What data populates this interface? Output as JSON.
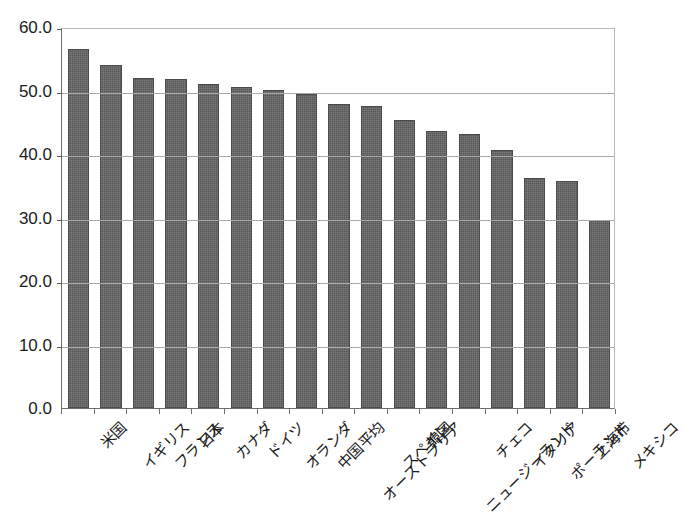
{
  "chart_data": {
    "type": "bar",
    "title": "",
    "subtitle": "",
    "xlabel": "",
    "ylabel": "",
    "ylim": [
      0.0,
      60.0
    ],
    "ytick_step": 10.0,
    "ytick_labels": [
      "60.0",
      "50.0",
      "40.0",
      "30.0",
      "20.0",
      "10.0",
      "0.0"
    ],
    "ytick_values": [
      60.0,
      50.0,
      40.0,
      30.0,
      20.0,
      10.0,
      0.0
    ],
    "grid": true,
    "grid_axis": "y",
    "legend": false,
    "legend_position": "none",
    "bar_color": "#575757",
    "bar_edge_color": "#4a4a4a",
    "axis_color": "#6e6e6e",
    "gridline_color": "#a9a9a9",
    "background_color": "#ffffff",
    "categories": [
      "米国",
      "イギリス",
      "フランス",
      "日本",
      "カナダ",
      "ドイツ",
      "オランダ",
      "中国平均",
      "オーストラリア",
      "スペイン",
      "韓国",
      "ニュージーランド",
      "チェコ",
      "イタリア",
      "ポーランド",
      "上海市",
      "メキシコ"
    ],
    "values": [
      56.5,
      54.0,
      52.0,
      51.8,
      51.0,
      50.6,
      50.1,
      49.4,
      47.8,
      47.6,
      45.4,
      43.6,
      43.1,
      40.6,
      36.3,
      35.8,
      29.6
    ],
    "series": [
      {
        "name": "",
        "values": [
          56.5,
          54.0,
          52.0,
          51.8,
          51.0,
          50.6,
          50.1,
          49.4,
          47.8,
          47.6,
          45.4,
          43.6,
          43.1,
          40.6,
          36.3,
          35.8,
          29.6
        ]
      }
    ]
  }
}
